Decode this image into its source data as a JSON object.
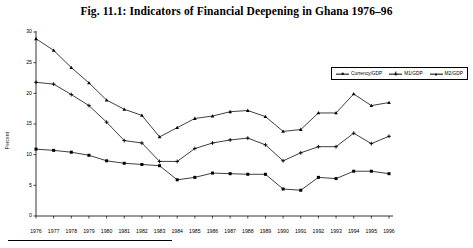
{
  "figure": {
    "title": "Fig. 11.1:  Indicators of Financial Deepening in Ghana 1976–96"
  },
  "chart_data": {
    "type": "line",
    "title": "Fig. 11.1:  Indicators of Financial Deepening in Ghana 1976–96",
    "xlabel": "",
    "ylabel": "Percent",
    "ylim": [
      0,
      30
    ],
    "yticks": [
      0,
      5,
      10,
      15,
      20,
      25,
      30
    ],
    "ytick_labels": [
      "0",
      "5",
      "10",
      "15",
      "20",
      "25",
      "30"
    ],
    "grid": false,
    "legend_position": "top-right",
    "categories": [
      "1976",
      "1977",
      "1978",
      "1979",
      "1980",
      "1981",
      "1982",
      "1983",
      "1984",
      "1985",
      "1986",
      "1987",
      "1988",
      "1989",
      "1990",
      "1991",
      "1992",
      "1993",
      "1994",
      "1995",
      "1996"
    ],
    "series": [
      {
        "name": "Currency/GDP",
        "marker": "square",
        "values": [
          10.9,
          10.7,
          10.4,
          9.9,
          9.0,
          8.6,
          8.4,
          8.2,
          5.9,
          6.3,
          7.0,
          6.9,
          6.8,
          6.8,
          4.4,
          4.2,
          6.3,
          6.1,
          7.3,
          7.3,
          6.9
        ]
      },
      {
        "name": "M1/GDP",
        "marker": "plus",
        "values": [
          21.8,
          21.5,
          19.8,
          18.0,
          15.3,
          12.3,
          11.9,
          8.9,
          8.9,
          11.0,
          11.9,
          12.4,
          12.7,
          11.6,
          9.0,
          10.3,
          11.3,
          11.3,
          13.5,
          11.8,
          13.0
        ]
      },
      {
        "name": "M2/GDP",
        "marker": "triangle",
        "values": [
          28.9,
          27.0,
          24.2,
          21.7,
          18.9,
          17.4,
          16.4,
          12.9,
          14.4,
          15.9,
          16.3,
          17.0,
          17.2,
          16.2,
          13.8,
          14.1,
          16.8,
          16.8,
          19.9,
          18.0,
          18.5
        ]
      }
    ]
  },
  "legend": {
    "items": [
      {
        "label": "Currency/GDP",
        "marker": "square"
      },
      {
        "label": "M1/GDP",
        "marker": "plus"
      },
      {
        "label": "M2/GDP",
        "marker": "triangle"
      }
    ]
  }
}
